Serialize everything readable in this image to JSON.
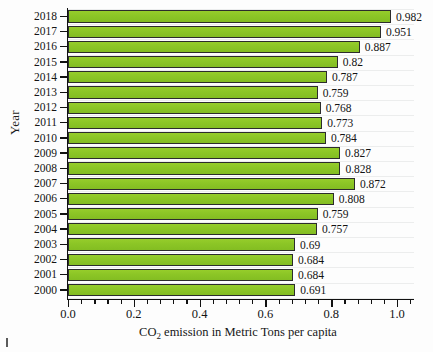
{
  "chart_data": {
    "type": "bar",
    "orientation": "horizontal",
    "title": "",
    "xlabel": "CO2 emission in Metric Tons per capita",
    "xlabel_parts": {
      "pre": "CO",
      "sub": "2",
      "post": " emission in Metric Tons per capita"
    },
    "ylabel": "Year",
    "xlim": [
      0.0,
      1.05
    ],
    "xticks": [
      "0.0",
      "0.2",
      "0.4",
      "0.6",
      "0.8",
      "1.0"
    ],
    "xtick_values": [
      0.0,
      0.2,
      0.4,
      0.6,
      0.8,
      1.0
    ],
    "minor_ticks_per_interval": 4,
    "grid": true,
    "legend": "none",
    "bar_color": "#8CC626",
    "bar_edge_color": "#2C2C2C",
    "categories": [
      "2018",
      "2017",
      "2016",
      "2015",
      "2014",
      "2013",
      "2012",
      "2011",
      "2010",
      "2009",
      "2008",
      "2007",
      "2006",
      "2005",
      "2004",
      "2003",
      "2002",
      "2001",
      "2000"
    ],
    "values": [
      0.982,
      0.951,
      0.887,
      0.82,
      0.787,
      0.759,
      0.768,
      0.773,
      0.784,
      0.827,
      0.828,
      0.872,
      0.808,
      0.759,
      0.757,
      0.69,
      0.684,
      0.684,
      0.691
    ],
    "value_labels": [
      "0.982",
      "0.951",
      "0.887",
      "0.82",
      "0.787",
      "0.759",
      "0.768",
      "0.773",
      "0.784",
      "0.827",
      "0.828",
      "0.872",
      "0.808",
      "0.759",
      "0.757",
      "0.69",
      "0.684",
      "0.684",
      "0.691"
    ]
  }
}
